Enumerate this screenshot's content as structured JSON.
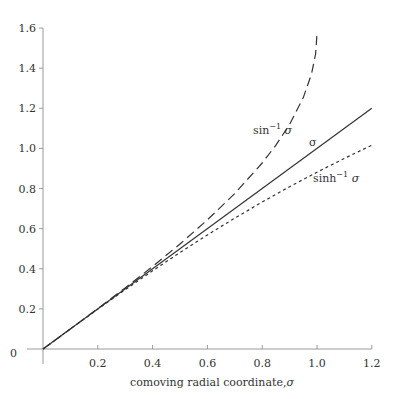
{
  "chart_data": {
    "type": "line",
    "title": "",
    "xlabel": "comoving radial coordinate, σ",
    "ylabel": "",
    "xlim": [
      0,
      1.2
    ],
    "ylim": [
      0,
      1.6
    ],
    "grid": false,
    "legend": "inline labels",
    "x_ticks": [
      "0.2",
      "0.4",
      "0.6",
      "0.8",
      "1.0",
      "1.2"
    ],
    "y_ticks": [
      "0.2",
      "0.4",
      "0.6",
      "0.8",
      "1.0",
      "1.2",
      "1.4",
      "1.6"
    ],
    "origin_label": "0",
    "series": [
      {
        "name": "sin⁻¹ σ",
        "style": "dashed",
        "x": [
          0,
          0.1,
          0.2,
          0.3,
          0.4,
          0.5,
          0.6,
          0.7,
          0.8,
          0.85,
          0.9,
          0.95,
          0.98,
          0.995,
          1.0
        ],
        "values": [
          0,
          0.1002,
          0.2014,
          0.3047,
          0.4115,
          0.5236,
          0.6435,
          0.7754,
          0.9273,
          1.016,
          1.1198,
          1.2532,
          1.3708,
          1.4707,
          1.5708
        ]
      },
      {
        "name": "σ",
        "style": "solid",
        "x": [
          0,
          1.2
        ],
        "values": [
          0,
          1.2
        ]
      },
      {
        "name": "sinh⁻¹ σ",
        "style": "dotted",
        "x": [
          0,
          0.1,
          0.2,
          0.3,
          0.4,
          0.5,
          0.6,
          0.7,
          0.8,
          0.9,
          1.0,
          1.1,
          1.2
        ],
        "values": [
          0,
          0.0998,
          0.1987,
          0.2957,
          0.39,
          0.4812,
          0.5688,
          0.6527,
          0.7327,
          0.8089,
          0.8814,
          0.9503,
          1.016
        ]
      }
    ],
    "annotations": [
      {
        "text": "sin⁻¹ σ",
        "near": [
          0.85,
          1.2
        ]
      },
      {
        "text": "σ",
        "near": [
          0.93,
          0.98
        ]
      },
      {
        "text": "sinh⁻¹ σ",
        "near": [
          0.97,
          0.8
        ]
      }
    ]
  },
  "labels": {
    "xlabel_text": "comoving radial coordinate,",
    "xlabel_sym": "σ",
    "origin": "0",
    "asin_base": "sin",
    "asin_sup": "−1",
    "asin_sym": " σ",
    "sigma": "σ",
    "asinh_base": "sinh",
    "asinh_sup": "−1",
    "asinh_sym": " σ"
  },
  "colors": {
    "axis": "#9a9a9a",
    "curve": "#333333",
    "text": "#333333"
  }
}
